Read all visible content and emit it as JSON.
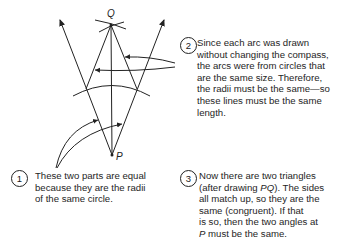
{
  "diagram": {
    "points": {
      "Q": {
        "label": "Q",
        "x": 111,
        "y": 25
      },
      "P": {
        "label": "P",
        "x": 112,
        "y": 155
      }
    },
    "stroke_color": "#222222"
  },
  "notes": [
    {
      "number": "1",
      "lines": [
        "These two parts are equal",
        "because they are the radii",
        "of the same circle."
      ]
    },
    {
      "number": "2",
      "lines": [
        "Since each arc was drawn",
        "without changing the compass,",
        "the arcs were from circles that",
        "are the same size.  Therefore,",
        "the radii must be the same—so",
        "these lines must be the same",
        "length."
      ]
    },
    {
      "number": "3",
      "lines_rich": [
        {
          "pre": "Now there are two triangles",
          "em": "",
          "post": ""
        },
        {
          "pre": "(after drawing ",
          "em": "PQ",
          "post": ").  The sides"
        },
        {
          "pre": "all match up, so they are the",
          "em": "",
          "post": ""
        },
        {
          "pre": "same (congruent).  If that",
          "em": "",
          "post": ""
        },
        {
          "pre": "is so, then the two angles at",
          "em": "",
          "post": ""
        },
        {
          "pre": "",
          "em": "P",
          "post": " must be the same."
        }
      ]
    }
  ]
}
